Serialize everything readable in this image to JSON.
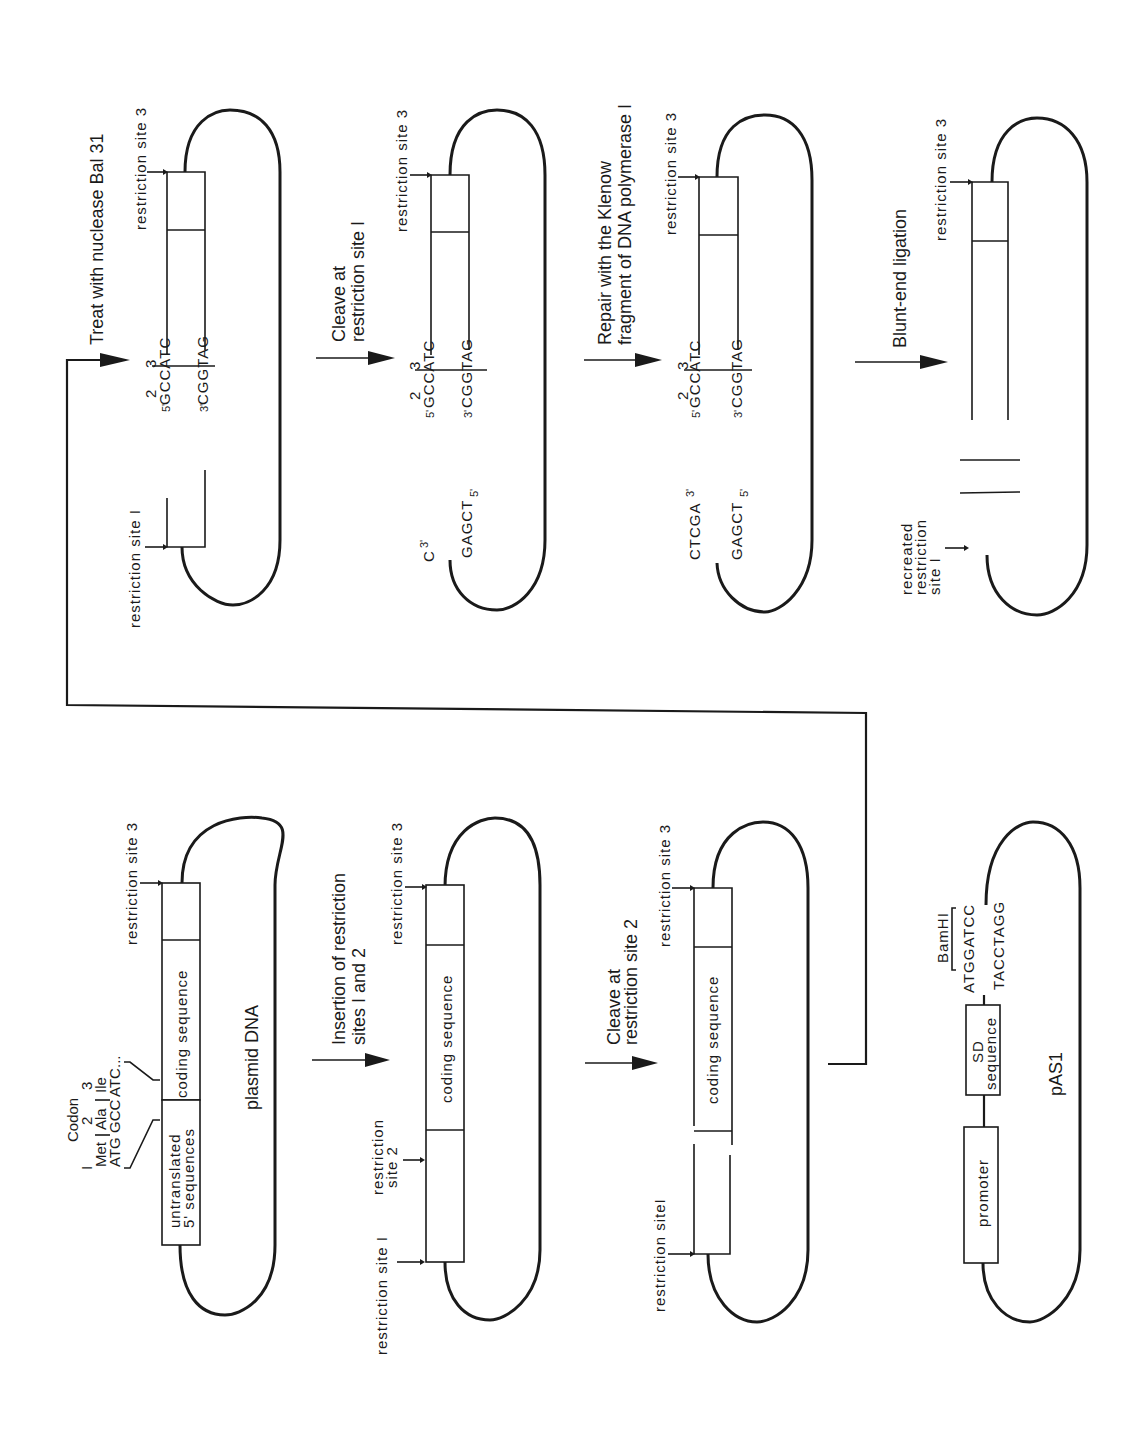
{
  "figure": {
    "orientation": "rotated-90-ccw",
    "line_color": "#1a1a1a",
    "background": "#ffffff"
  },
  "labels": {
    "restriction_site_1": "restriction site I",
    "restriction_site_1_compact": "restriction siteI",
    "restriction_site_2_line1": "restriction",
    "restriction_site_2_line2": "site 2",
    "restriction_site_3": "restriction site 3",
    "coding_sequence": "coding sequence",
    "untranslated_line1": "untranslated",
    "untranslated_line2": "5' sequences",
    "plasmid_dna": "plasmid DNA",
    "promoter": "promoter",
    "sd_line1": "SD",
    "sd_line2": "sequence",
    "pas1": "pAS1",
    "bamhi": "BamHI",
    "bamhi_top": "ATGGATCC",
    "bamhi_bottom": "TACCTAGG",
    "recreated_line1": "recreated",
    "recreated_line2": "restriction",
    "recreated_line3": "site I"
  },
  "codon_annotation": {
    "title": "Codon",
    "numbers": [
      "I",
      "2",
      "3"
    ],
    "amino_acids": [
      "Met",
      "Ala",
      "Ile"
    ],
    "sequence": [
      "ATG",
      "GCC",
      "ATC",
      "..."
    ]
  },
  "steps": [
    {
      "id": "insertion",
      "line1": "Insertion of restriction",
      "line2": "sites I and 2"
    },
    {
      "id": "cleave2",
      "line1": "Cleave at",
      "line2": "restriction site 2"
    },
    {
      "id": "bal31",
      "line1": "Treat with nuclease Bal 31",
      "line2": ""
    },
    {
      "id": "cleave1",
      "line1": "Cleave at",
      "line2": "restriction site I"
    },
    {
      "id": "klenow",
      "line1": "Repair with the Klenow",
      "line2": "fragment of DNA polymerase I"
    },
    {
      "id": "ligation",
      "line1": "Blunt-end ligation",
      "line2": ""
    }
  ],
  "sequences": {
    "bal31": {
      "num2": "2",
      "num3": "3",
      "top_prefix": "5'",
      "top": "GCCATC",
      "bottom_prefix": "3'",
      "bottom": "CGGTAG"
    },
    "cleave1": {
      "num2": "2",
      "num3": "3",
      "top_prefix": "5'",
      "top": "GCCATC",
      "bottom_prefix": "3'",
      "bottom": "CGGTAG",
      "left_top": "C",
      "left_top_suffix": "3'",
      "left_bottom": "GAGCT",
      "left_bottom_suffix": "5'"
    },
    "klenow": {
      "num2": "2",
      "num3": "3",
      "top_prefix": "5'",
      "top": "GCCATC",
      "bottom_prefix": "3'",
      "bottom": "CGGTAG",
      "left_top": "CTCGA",
      "left_top_suffix": "3'",
      "left_bottom": "GAGCT",
      "left_bottom_suffix": "5'"
    },
    "ligation": {
      "num2": "2",
      "num3": "3",
      "top": "CTCGAGCCATC",
      "bottom": "GAGCTCGGTAG"
    }
  }
}
